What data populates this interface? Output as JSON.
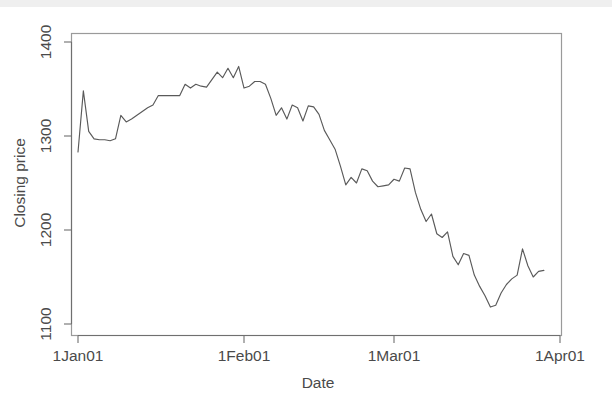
{
  "figure": {
    "background_color": "#ffffff",
    "line_color": "#5a5a5a",
    "axis_color": "#6f6f6f",
    "box_color": "#9a9a9a"
  },
  "axes": {
    "y_label": "Closing price",
    "x_label": "Date",
    "y_ticks": [
      "1100",
      "1200",
      "1300",
      "1400"
    ],
    "x_ticks": [
      "1Jan01",
      "1Feb01",
      "1Mar01",
      "1Apr01"
    ]
  },
  "chart_data": {
    "type": "line",
    "title": "",
    "xlabel": "Date",
    "ylabel": "Closing price",
    "xlim": [
      0,
      90
    ],
    "ylim": [
      1100,
      1400
    ],
    "grid": false,
    "legend": null,
    "x_tick_labels": [
      "1Jan01",
      "1Feb01",
      "1Mar01",
      "1Apr01"
    ],
    "x_tick_values": [
      0,
      31,
      59,
      90
    ],
    "y_tick_values": [
      1100,
      1200,
      1300,
      1400
    ],
    "x_axis_type": "date",
    "series": [
      {
        "name": "Closing price",
        "x": [
          0,
          1,
          2,
          3,
          4,
          5,
          6,
          7,
          8,
          9,
          10,
          11,
          12,
          13,
          14,
          15,
          16,
          17,
          18,
          19,
          20,
          21,
          22,
          23,
          24,
          25,
          26,
          27,
          28,
          29,
          30,
          31,
          32,
          33,
          34,
          35,
          36,
          37,
          38,
          39,
          40,
          41,
          42,
          43,
          44,
          45,
          46,
          47,
          48,
          49,
          50,
          51,
          52,
          53,
          54,
          55,
          56,
          57,
          58,
          59,
          60,
          61,
          62,
          63,
          64,
          65,
          66,
          67,
          68,
          69,
          70,
          71,
          72,
          73,
          74,
          75,
          76,
          77,
          78,
          79,
          80,
          81,
          82,
          83,
          84,
          85,
          86,
          87
        ],
        "values": [
          1283,
          1348,
          1305,
          1297,
          1296,
          1296,
          1295,
          1297,
          1322,
          1315,
          1318,
          1322,
          1326,
          1330,
          1333,
          1343,
          1343,
          1343,
          1343,
          1343,
          1355,
          1351,
          1355,
          1353,
          1352,
          1360,
          1368,
          1362,
          1372,
          1362,
          1374,
          1351,
          1353,
          1358,
          1358,
          1355,
          1340,
          1322,
          1330,
          1318,
          1333,
          1330,
          1316,
          1332,
          1331,
          1323,
          1306,
          1296,
          1286,
          1268,
          1248,
          1256,
          1250,
          1265,
          1263,
          1252,
          1246,
          1247,
          1248,
          1254,
          1252,
          1266,
          1265,
          1240,
          1222,
          1209,
          1217,
          1196,
          1192,
          1198,
          1172,
          1163,
          1175,
          1173,
          1152,
          1140,
          1130,
          1118,
          1120,
          1133,
          1142,
          1148,
          1152,
          1180,
          1162,
          1150,
          1156,
          1157
        ]
      }
    ]
  }
}
